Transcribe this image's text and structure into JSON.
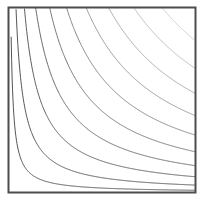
{
  "figure": {
    "title": "",
    "background_color": "#ffffff",
    "width": 209,
    "height": 202
  },
  "frame": {
    "name": "plot-border",
    "x": 8.5,
    "y": 7.5,
    "width": 187,
    "height": 185,
    "stroke_color": "#4d4d4d",
    "stroke_width": 2.0,
    "fill": "none"
  },
  "chart_data": {
    "type": "line",
    "title": "",
    "subtitle": "",
    "xlabel": "",
    "ylabel": "",
    "xlim": [
      0,
      1
    ],
    "ylim": [
      0,
      1
    ],
    "grid": false,
    "legend": null,
    "legend_position": "none",
    "annotations": [],
    "tick_labels": {
      "x": [],
      "y": []
    },
    "curve_equation": "y = k / x",
    "series": [
      {
        "name": "k = 0.012",
        "k": 0.012,
        "stroke_color": "#545454",
        "stroke_width": 1.0
      },
      {
        "name": "k = 0.040",
        "k": 0.04,
        "stroke_color": "#565656",
        "stroke_width": 1.0
      },
      {
        "name": "k = 0.085",
        "k": 0.085,
        "stroke_color": "#5e5e5e",
        "stroke_width": 1.0
      },
      {
        "name": "k = 0.145",
        "k": 0.145,
        "stroke_color": "#6a6a6a",
        "stroke_width": 1.0
      },
      {
        "name": "k = 0.220",
        "k": 0.22,
        "stroke_color": "#767676",
        "stroke_width": 1.0
      },
      {
        "name": "k = 0.310",
        "k": 0.31,
        "stroke_color": "#858585",
        "stroke_width": 1.0
      },
      {
        "name": "k = 0.415",
        "k": 0.415,
        "stroke_color": "#969696",
        "stroke_width": 1.0
      },
      {
        "name": "k = 0.535",
        "k": 0.535,
        "stroke_color": "#a8a8a8",
        "stroke_width": 1.0
      },
      {
        "name": "k = 0.670",
        "k": 0.67,
        "stroke_color": "#bcbcbc",
        "stroke_width": 1.0
      },
      {
        "name": "k = 0.820",
        "k": 0.82,
        "stroke_color": "#d0d0d0",
        "stroke_width": 1.0
      }
    ]
  }
}
